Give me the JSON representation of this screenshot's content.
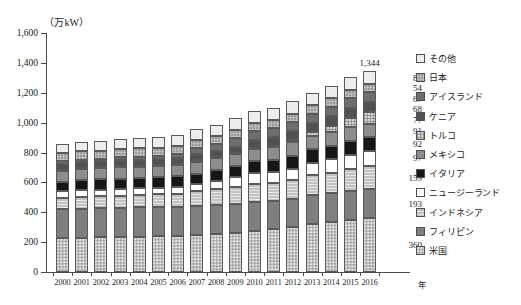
{
  "axis": {
    "unit_label": "（万kW）",
    "x_unit_label": "年",
    "y_ticks": [
      "1,600",
      "1,400",
      "1,200",
      "1,000",
      "800",
      "600",
      "400",
      "200",
      "0"
    ]
  },
  "callouts": {
    "total_2016": "1,344",
    "values": [
      "87",
      "54",
      "67",
      "68",
      "77",
      "91",
      "92",
      "97",
      "159",
      "193",
      "360"
    ]
  },
  "legend": {
    "items": [
      {
        "label": "その他",
        "fill": "f-sonota",
        "color": "#ededed"
      },
      {
        "label": "日本",
        "fill": "f-nihon",
        "color": "#9a9a9a"
      },
      {
        "label": "アイスランド",
        "fill": "f-iceland",
        "color": "#6e6e6e"
      },
      {
        "label": "ケニア",
        "fill": "f-kenya",
        "color": "#515151"
      },
      {
        "label": "トルコ",
        "fill": "f-turkey",
        "color": "#d5d5d5"
      },
      {
        "label": "メキシコ",
        "fill": "f-mexico",
        "color": "#8d8d8d"
      },
      {
        "label": "イタリア",
        "fill": "f-italy",
        "color": "#161616"
      },
      {
        "label": "ニュージーランド",
        "fill": "f-nz",
        "color": "#ffffff"
      },
      {
        "label": "インドネシア",
        "fill": "f-indonesia",
        "color": "#c2c2c2"
      },
      {
        "label": "フィリピン",
        "fill": "f-philippines",
        "color": "#7f7f7f"
      },
      {
        "label": "米国",
        "fill": "f-usa",
        "color": "#bdbdbd"
      }
    ]
  },
  "chart_data": {
    "type": "bar",
    "title": "",
    "xlabel": "年",
    "ylabel": "万kW",
    "ylim": [
      0,
      1600
    ],
    "ytick_step": 200,
    "grid": false,
    "stacked": true,
    "legend_position": "right",
    "categories": [
      "2000",
      "2001",
      "2002",
      "2003",
      "2004",
      "2005",
      "2006",
      "2007",
      "2008",
      "2009",
      "2010",
      "2011",
      "2012",
      "2013",
      "2014",
      "2015",
      "2016"
    ],
    "series": [
      {
        "name": "米国",
        "values": [
          226,
          228,
          232,
          234,
          236,
          239,
          242,
          246,
          253,
          262,
          272,
          285,
          299,
          323,
          338,
          350,
          360
        ]
      },
      {
        "name": "フィリピン",
        "values": [
          193,
          194,
          195,
          196,
          196,
          196,
          196,
          196,
          196,
          196,
          196,
          190,
          190,
          190,
          192,
          193,
          193
        ]
      },
      {
        "name": "インドネシア",
        "values": [
          79,
          80,
          81,
          82,
          84,
          86,
          87,
          99,
          105,
          113,
          119,
          119,
          125,
          134,
          134,
          144,
          159
        ]
      },
      {
        "name": "ニュージーランド",
        "values": [
          44,
          44,
          44,
          44,
          44,
          44,
          44,
          47,
          57,
          63,
          76,
          76,
          78,
          85,
          90,
          97,
          97
        ]
      },
      {
        "name": "イタリア",
        "values": [
          62,
          68,
          68,
          70,
          71,
          71,
          71,
          71,
          72,
          74,
          79,
          81,
          88,
          90,
          92,
          92,
          92
        ]
      },
      {
        "name": "メキシコ",
        "values": [
          75,
          75,
          75,
          75,
          75,
          75,
          75,
          79,
          79,
          79,
          80,
          84,
          88,
          90,
          92,
          92,
          91
        ]
      },
      {
        "name": "トルコ",
        "values": [
          2,
          2,
          2,
          2,
          2,
          2,
          2,
          2,
          2,
          2,
          9,
          11,
          16,
          23,
          40,
          62,
          77
        ]
      },
      {
        "name": "ケニア",
        "values": [
          45,
          45,
          45,
          45,
          45,
          45,
          45,
          49,
          49,
          49,
          53,
          57,
          60,
          60,
          64,
          66,
          68
        ]
      },
      {
        "name": "アイスランド",
        "values": [
          17,
          17,
          17,
          20,
          20,
          20,
          28,
          42,
          42,
          58,
          58,
          58,
          60,
          66,
          66,
          66,
          67
        ]
      },
      {
        "name": "日本",
        "values": [
          54,
          54,
          54,
          54,
          54,
          54,
          54,
          54,
          54,
          54,
          54,
          54,
          54,
          54,
          54,
          54,
          54
        ]
      },
      {
        "name": "その他",
        "values": [
          62,
          63,
          65,
          66,
          68,
          70,
          72,
          75,
          77,
          80,
          82,
          83,
          84,
          85,
          86,
          87,
          87
        ]
      }
    ],
    "totals": [
      859,
      870,
      878,
      888,
      895,
      902,
      916,
      960,
      986,
      1030,
      1078,
      1098,
      1142,
      1200,
      1248,
      1303,
      1344
    ],
    "labeled_bar": "2016",
    "labeled_total": 1344
  }
}
